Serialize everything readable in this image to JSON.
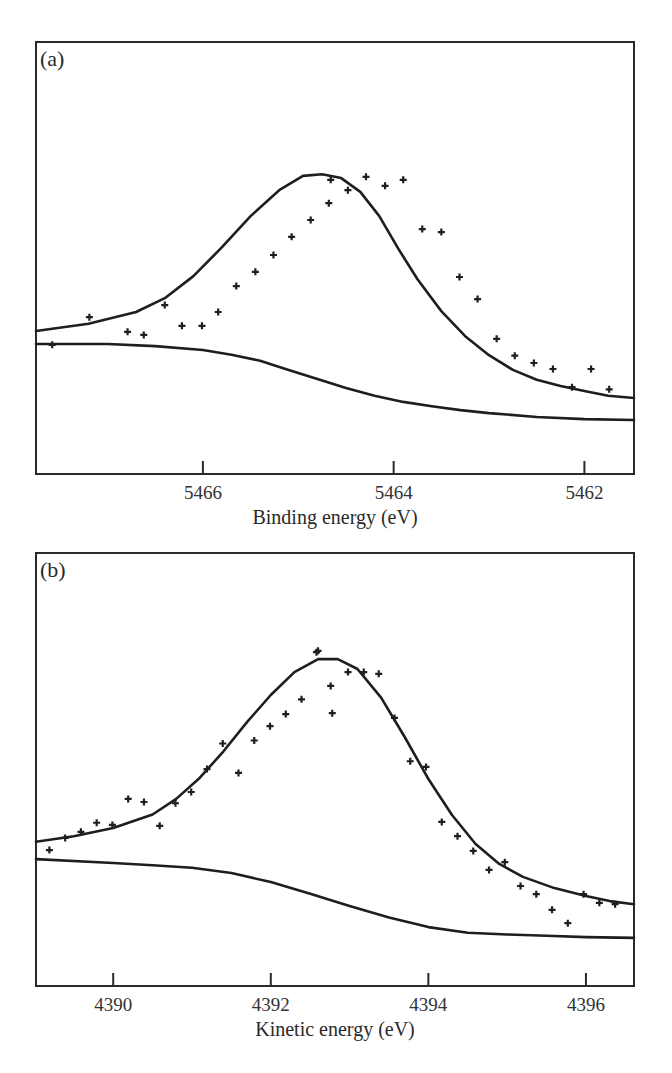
{
  "chart_data": [
    {
      "type": "scatter",
      "panel_label": "(a)",
      "title": "",
      "xlabel": "Binding energy (eV)",
      "ylabel": "",
      "x_reversed": true,
      "xlim": [
        5467.75,
        5461.48
      ],
      "ylim": [
        0,
        100
      ],
      "grid": false,
      "xticks": [
        5466,
        5464,
        5462
      ],
      "xtick_labels": [
        "5466",
        "5464",
        "5462"
      ],
      "frame": {
        "left": 36,
        "right": 634,
        "top": 42,
        "bottom": 474
      },
      "series": [
        {
          "name": "data",
          "kind": "markers",
          "marker": "plus",
          "x": [
            5467.58,
            5467.19,
            5466.79,
            5466.62,
            5466.4,
            5466.22,
            5466.01,
            5465.84,
            5465.65,
            5465.45,
            5465.26,
            5465.07,
            5464.87,
            5464.68,
            5464.66,
            5464.48,
            5464.29,
            5464.09,
            5463.9,
            5463.7,
            5463.5,
            5463.31,
            5463.12,
            5462.92,
            5462.73,
            5462.53,
            5462.33,
            5462.13,
            5461.93,
            5461.74
          ],
          "y": [
            29.9,
            36.3,
            32.9,
            32.2,
            39.1,
            34.3,
            34.3,
            37.5,
            43.5,
            46.8,
            50.7,
            54.9,
            58.8,
            62.7,
            68.1,
            65.7,
            68.8,
            66.7,
            68.1,
            56.7,
            56.0,
            45.6,
            40.5,
            31.3,
            27.4,
            25.7,
            24.3,
            20.1,
            24.3,
            19.6
          ]
        },
        {
          "name": "fit",
          "kind": "line",
          "x": [
            5467.75,
            5467.2,
            5466.7,
            5466.4,
            5466.1,
            5465.8,
            5465.5,
            5465.2,
            5464.95,
            5464.75,
            5464.55,
            5464.35,
            5464.15,
            5463.95,
            5463.75,
            5463.5,
            5463.25,
            5463.0,
            5462.75,
            5462.5,
            5462.25,
            5462.0,
            5461.75,
            5461.48
          ],
          "y": [
            33.1,
            34.8,
            37.5,
            40.7,
            45.8,
            52.5,
            59.7,
            65.7,
            69.0,
            69.4,
            68.5,
            65.3,
            59.7,
            52.1,
            45.1,
            37.7,
            31.9,
            27.5,
            24.1,
            21.8,
            20.4,
            19.2,
            18.1,
            17.6
          ]
        },
        {
          "name": "background",
          "kind": "line",
          "x": [
            5467.75,
            5467.0,
            5466.5,
            5466.0,
            5465.7,
            5465.4,
            5465.1,
            5464.8,
            5464.5,
            5464.2,
            5463.9,
            5463.6,
            5463.3,
            5463.0,
            5462.5,
            5462.0,
            5461.48
          ],
          "y": [
            30.1,
            30.1,
            29.6,
            28.7,
            27.6,
            26.2,
            24.1,
            22.0,
            19.9,
            18.1,
            16.7,
            15.7,
            14.8,
            14.1,
            13.2,
            12.7,
            12.5
          ]
        }
      ]
    },
    {
      "type": "scatter",
      "panel_label": "(b)",
      "title": "",
      "xlabel": "Kinetic energy (eV)",
      "ylabel": "",
      "x_reversed": false,
      "xlim": [
        4389.02,
        4396.61
      ],
      "ylim": [
        0,
        100
      ],
      "grid": false,
      "xticks": [
        4390,
        4392,
        4394,
        4396
      ],
      "xtick_labels": [
        "4390",
        "4392",
        "4394",
        "4396"
      ],
      "frame": {
        "left": 36,
        "right": 634,
        "top": 553,
        "bottom": 986
      },
      "series": [
        {
          "name": "data",
          "kind": "markers",
          "marker": "plus",
          "x": [
            4389.19,
            4389.39,
            4389.59,
            4389.79,
            4389.99,
            4390.19,
            4390.39,
            4390.59,
            4390.79,
            4390.99,
            4391.19,
            4391.39,
            4391.59,
            4391.79,
            4391.99,
            4392.19,
            4392.39,
            4392.58,
            4392.6,
            4392.76,
            4392.78,
            4392.98,
            4393.18,
            4393.37,
            4393.57,
            4393.77,
            4393.97,
            4394.17,
            4394.37,
            4394.57,
            4394.77,
            4394.97,
            4395.17,
            4395.37,
            4395.57,
            4395.77,
            4395.97,
            4396.17,
            4396.37
          ],
          "y": [
            31.4,
            34.2,
            35.6,
            37.7,
            37.2,
            43.2,
            42.5,
            37.0,
            42.2,
            44.8,
            50.1,
            56.0,
            49.2,
            56.7,
            60.0,
            62.8,
            66.2,
            77.1,
            77.4,
            69.3,
            63.0,
            72.5,
            72.5,
            72.1,
            61.9,
            51.9,
            50.6,
            37.9,
            34.6,
            31.2,
            26.8,
            28.6,
            23.1,
            21.2,
            17.6,
            14.5,
            21.2,
            19.2,
            18.9
          ]
        },
        {
          "name": "fit",
          "kind": "line",
          "x": [
            4389.02,
            4389.5,
            4390.0,
            4390.5,
            4390.8,
            4391.1,
            4391.4,
            4391.7,
            4392.0,
            4392.3,
            4392.6,
            4392.85,
            4393.1,
            4393.4,
            4393.7,
            4394.0,
            4394.3,
            4394.6,
            4394.9,
            4395.2,
            4395.6,
            4396.0,
            4396.3,
            4396.61
          ],
          "y": [
            33.3,
            34.6,
            36.5,
            39.6,
            43.2,
            48.1,
            54.2,
            61.0,
            67.2,
            72.5,
            75.5,
            75.5,
            73.2,
            66.6,
            57.5,
            47.8,
            39.5,
            32.8,
            28.2,
            25.2,
            22.6,
            20.8,
            19.6,
            18.9
          ]
        },
        {
          "name": "background",
          "kind": "line",
          "x": [
            4389.02,
            4390.0,
            4390.5,
            4391.0,
            4391.5,
            4392.0,
            4392.5,
            4393.0,
            4393.5,
            4394.0,
            4394.5,
            4395.0,
            4395.5,
            4396.0,
            4396.61
          ],
          "y": [
            29.3,
            28.4,
            27.9,
            27.3,
            26.1,
            24.0,
            21.3,
            18.5,
            15.8,
            13.6,
            12.3,
            11.9,
            11.6,
            11.3,
            11.1
          ]
        }
      ]
    }
  ]
}
